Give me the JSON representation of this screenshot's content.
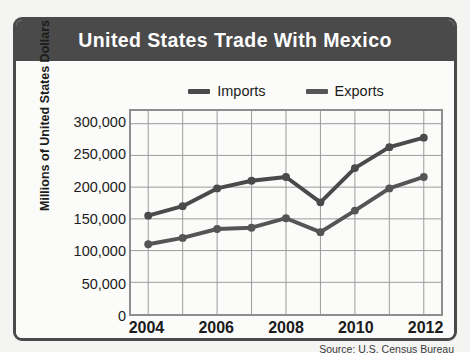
{
  "figure": {
    "title": "United States Trade With Mexico",
    "title_bg_color": "#4a4a4a",
    "title_text_color": "#ffffff",
    "frame_color": "#4a4a4a",
    "plot_background": "#fbfbfa",
    "source_note": "Source: U.S. Census Bureau"
  },
  "legend": {
    "position": "top-center",
    "items": [
      {
        "label": "Imports",
        "color": "#4a4a4a",
        "icon": "line-swatch-icon"
      },
      {
        "label": "Exports",
        "color": "#555555",
        "icon": "line-swatch-icon"
      }
    ]
  },
  "axes": {
    "y_title": "Millions of United States Dollars",
    "y_ticks": [
      "0",
      "50,000",
      "100,000",
      "150,000",
      "200,000",
      "250,000",
      "300,000"
    ],
    "x_ticks": [
      "2004",
      "2006",
      "2008",
      "2010",
      "2012"
    ]
  },
  "chart_data": {
    "type": "line",
    "title": "United States Trade With Mexico",
    "xlabel": "",
    "ylabel": "Millions of United States Dollars",
    "x": [
      2004,
      2005,
      2006,
      2007,
      2008,
      2009,
      2010,
      2011,
      2012
    ],
    "xlim": [
      2003.5,
      2012.5
    ],
    "ylim": [
      0,
      320000
    ],
    "ytick_values": [
      0,
      50000,
      100000,
      150000,
      200000,
      250000,
      300000
    ],
    "ytick_labels": [
      "0",
      "50,000",
      "100,000",
      "150,000",
      "200,000",
      "250,000",
      "300,000"
    ],
    "xtick_values": [
      2004,
      2006,
      2008,
      2010,
      2012
    ],
    "xtick_labels": [
      "2004",
      "2006",
      "2008",
      "2010",
      "2012"
    ],
    "grid": true,
    "legend_position": "top-center",
    "markers": "circle",
    "series": [
      {
        "name": "Imports",
        "color": "#4a4a4a",
        "values": [
          155000,
          170000,
          198000,
          210000,
          216000,
          176000,
          230000,
          263000,
          278000
        ]
      },
      {
        "name": "Exports",
        "color": "#555555",
        "values": [
          110000,
          120000,
          134000,
          136000,
          151000,
          129000,
          163000,
          198000,
          216000
        ]
      }
    ]
  }
}
